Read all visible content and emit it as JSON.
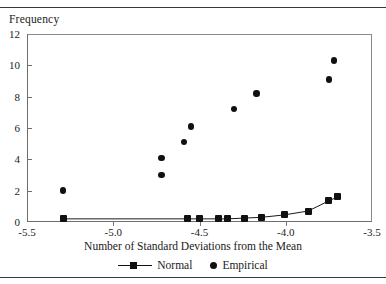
{
  "chart_data": {
    "type": "scatter",
    "title": "",
    "xlabel": "Number of Standard Deviations from the Mean",
    "ylabel": "Frequency",
    "xlim": [
      -5.5,
      -3.5
    ],
    "ylim": [
      0,
      12
    ],
    "xticks": [
      -5.5,
      -5.0,
      -4.5,
      -4.0,
      -3.5
    ],
    "xtick_labels": [
      "-5.5",
      "-5.0",
      "-4.5",
      "-4.0",
      "-3.5"
    ],
    "yticks": [
      0,
      2,
      4,
      6,
      8,
      10,
      12
    ],
    "ytick_labels": [
      "0",
      "2",
      "4",
      "6",
      "8",
      "10",
      "12"
    ],
    "grid": false,
    "legend_position": "bottom",
    "series": [
      {
        "name": "Normal",
        "marker": "square",
        "line": true,
        "color": "#111111",
        "points": [
          {
            "x": -5.29,
            "y": 0.2
          },
          {
            "x": -4.57,
            "y": 0.2
          },
          {
            "x": -4.5,
            "y": 0.2
          },
          {
            "x": -4.39,
            "y": 0.2
          },
          {
            "x": -4.34,
            "y": 0.2
          },
          {
            "x": -4.24,
            "y": 0.25
          },
          {
            "x": -4.14,
            "y": 0.3
          },
          {
            "x": -4.01,
            "y": 0.45
          },
          {
            "x": -3.87,
            "y": 0.7
          },
          {
            "x": -3.75,
            "y": 1.35
          },
          {
            "x": -3.7,
            "y": 1.6
          }
        ]
      },
      {
        "name": "Empirical",
        "marker": "circle",
        "line": false,
        "color": "#111111",
        "points": [
          {
            "x": -5.29,
            "y": 2.0
          },
          {
            "x": -4.72,
            "y": 4.1
          },
          {
            "x": -4.72,
            "y": 3.0
          },
          {
            "x": -4.55,
            "y": 6.1
          },
          {
            "x": -4.59,
            "y": 5.1
          },
          {
            "x": -4.3,
            "y": 7.2
          },
          {
            "x": -4.17,
            "y": 8.2
          },
          {
            "x": -3.72,
            "y": 10.3
          },
          {
            "x": -3.75,
            "y": 9.1
          }
        ]
      }
    ]
  },
  "legend": {
    "entries": [
      {
        "label": "Normal"
      },
      {
        "label": "Empirical"
      }
    ]
  }
}
